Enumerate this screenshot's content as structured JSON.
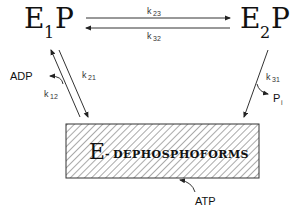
{
  "diagram": {
    "states": {
      "e1p": {
        "main": "E",
        "sub": "1",
        "tail": "P"
      },
      "e2p": {
        "main": "E",
        "sub": "2",
        "tail": "P"
      },
      "dephospho": {
        "main": "E",
        "dash": "-",
        "text": "DEPHOSPHOFORMS"
      }
    },
    "rates": {
      "k23": {
        "k": "k",
        "sub": "23"
      },
      "k32": {
        "k": "k",
        "sub": "32"
      },
      "k21": {
        "k": "k",
        "sub": "21"
      },
      "k12": {
        "k": "k",
        "sub": "12"
      },
      "k31": {
        "k": "k",
        "sub": "31"
      }
    },
    "species": {
      "adp": "ADP",
      "pi_main": "P",
      "pi_sub": "i",
      "atp": "ATP"
    },
    "colors": {
      "ink": "#111111",
      "hatch": "#555555"
    }
  }
}
